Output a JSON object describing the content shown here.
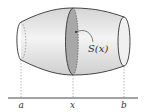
{
  "diagram": {
    "type": "solid-cross-section",
    "labels": {
      "cross_section": "S(x)",
      "left_bound": "a",
      "position": "x",
      "right_bound": "b"
    },
    "colors": {
      "solid_fill": "#ebebeb",
      "section_fill": "#a8a8a8",
      "outline": "#333333",
      "dashed": "#888888"
    }
  }
}
